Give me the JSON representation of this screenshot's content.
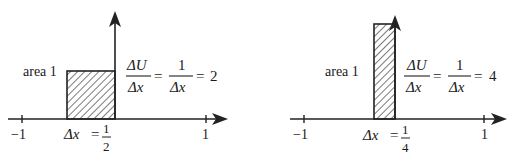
{
  "panels": [
    {
      "id": "left",
      "area_label": "area 1",
      "width_value": 0.5,
      "height_value": 2,
      "axis": {
        "min_label": "−1",
        "max_label": "1",
        "xmin": -1,
        "xmax": 1
      },
      "dx_label": "Δx",
      "dx_eq": "=",
      "dx_num": "1",
      "dx_den": "2",
      "ratio": {
        "num": "ΔU",
        "den": "Δx",
        "eq1": "=",
        "num2": "1",
        "den2": "Δx",
        "eq2": "=",
        "result": "2"
      }
    },
    {
      "id": "right",
      "area_label": "area 1",
      "width_value": 0.25,
      "height_value": 4,
      "axis": {
        "min_label": "−1",
        "max_label": "1",
        "xmin": -1,
        "xmax": 1
      },
      "dx_label": "Δx",
      "dx_eq": "=",
      "dx_num": "1",
      "dx_den": "4",
      "ratio": {
        "num": "ΔU",
        "den": "Δx",
        "eq1": "=",
        "num2": "1",
        "den2": "Δx",
        "eq2": "=",
        "result": "4"
      }
    }
  ]
}
